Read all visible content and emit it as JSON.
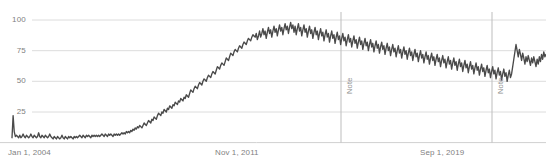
{
  "chart_data": {
    "type": "line",
    "title": "",
    "subtitle": "",
    "xlabel": "",
    "ylabel": "",
    "ylim": [
      0,
      100
    ],
    "grid": true,
    "legend": null,
    "legend_position": "none",
    "y_ticks": [
      100,
      75,
      50,
      25
    ],
    "y_tick_labels": [
      "100",
      "75",
      "50",
      "25"
    ],
    "x_tick_labels": [
      "Jan 1, 2004",
      "Nov 1, 2011",
      "Sep 1, 2019"
    ],
    "x_tick_positions_px": [
      8,
      215,
      420
    ],
    "annotations": [
      {
        "label": "Note",
        "x_px": 341
      },
      {
        "label": "Note",
        "x_px": 492
      }
    ],
    "line_color": "#4a4a4a",
    "grid_color": "#dcdcdc",
    "axis_text_color": "#7f7f7f",
    "series": [
      {
        "name": "Interest over time",
        "values": [
          4,
          22,
          9,
          5,
          6,
          5,
          4,
          6,
          4,
          5,
          7,
          5,
          4,
          6,
          5,
          4,
          5,
          7,
          5,
          4,
          6,
          5,
          4,
          5,
          8,
          5,
          4,
          6,
          5,
          4,
          6,
          5,
          4,
          5,
          7,
          5,
          4,
          3,
          5,
          4,
          3,
          5,
          4,
          3,
          4,
          6,
          4,
          3,
          5,
          4,
          3,
          5,
          4,
          5,
          4,
          3,
          5,
          4,
          5,
          4,
          5,
          6,
          5,
          4,
          6,
          5,
          4,
          6,
          5,
          6,
          5,
          4,
          6,
          5,
          6,
          5,
          6,
          5,
          6,
          5,
          6,
          7,
          6,
          5,
          7,
          6,
          5,
          7,
          6,
          7,
          6,
          5,
          7,
          6,
          7,
          6,
          7,
          6,
          7,
          8,
          7,
          8,
          7,
          9,
          8,
          9,
          8,
          10,
          9,
          11,
          10,
          12,
          11,
          13,
          12,
          14,
          13,
          12,
          14,
          16,
          15,
          14,
          16,
          18,
          17,
          16,
          19,
          18,
          21,
          20,
          19,
          22,
          24,
          23,
          22,
          25,
          24,
          27,
          26,
          25,
          28,
          27,
          30,
          29,
          28,
          31,
          30,
          33,
          32,
          31,
          34,
          33,
          36,
          35,
          34,
          37,
          36,
          39,
          38,
          37,
          40,
          43,
          42,
          41,
          44,
          46,
          45,
          44,
          47,
          49,
          48,
          47,
          50,
          52,
          51,
          50,
          53,
          55,
          54,
          53,
          56,
          58,
          57,
          56,
          59,
          62,
          61,
          60,
          63,
          65,
          64,
          63,
          66,
          69,
          68,
          67,
          70,
          73,
          72,
          71,
          74,
          76,
          75,
          74,
          77,
          79,
          78,
          77,
          80,
          82,
          81,
          80,
          83,
          85,
          84,
          83,
          86,
          88,
          87,
          86,
          89,
          84,
          87,
          91,
          86,
          89,
          93,
          88,
          91,
          85,
          90,
          94,
          89,
          92,
          86,
          91,
          95,
          90,
          93,
          87,
          92,
          96,
          91,
          94,
          88,
          93,
          97,
          92,
          95,
          89,
          94,
          98,
          93,
          96,
          90,
          95,
          88,
          93,
          97,
          91,
          94,
          87,
          92,
          96,
          90,
          93,
          86,
          91,
          95,
          89,
          92,
          85,
          90,
          94,
          88,
          91,
          84,
          89,
          93,
          87,
          90,
          83,
          88,
          92,
          86,
          89,
          82,
          87,
          91,
          85,
          88,
          81,
          86,
          90,
          84,
          87,
          80,
          85,
          89,
          83,
          86,
          79,
          84,
          88,
          82,
          85,
          78,
          83,
          87,
          81,
          84,
          77,
          82,
          86,
          80,
          83,
          76,
          81,
          85,
          79,
          82,
          75,
          80,
          84,
          78,
          81,
          74,
          79,
          83,
          77,
          80,
          73,
          78,
          82,
          76,
          79,
          72,
          77,
          81,
          75,
          78,
          71,
          76,
          80,
          74,
          77,
          70,
          75,
          79,
          73,
          76,
          69,
          74,
          78,
          72,
          75,
          68,
          73,
          77,
          71,
          74,
          67,
          72,
          76,
          70,
          73,
          66,
          71,
          75,
          69,
          72,
          65,
          70,
          74,
          68,
          71,
          64,
          69,
          73,
          67,
          70,
          63,
          68,
          72,
          66,
          69,
          62,
          67,
          71,
          65,
          68,
          61,
          66,
          70,
          64,
          67,
          60,
          65,
          69,
          63,
          66,
          59,
          64,
          68,
          62,
          65,
          58,
          63,
          67,
          61,
          64,
          57,
          62,
          66,
          60,
          63,
          56,
          61,
          65,
          59,
          62,
          55,
          60,
          64,
          58,
          61,
          54,
          59,
          63,
          57,
          60,
          53,
          58,
          62,
          56,
          59,
          52,
          57,
          61,
          55,
          58,
          51,
          56,
          60,
          54,
          57,
          50,
          55,
          59,
          53,
          56,
          62,
          68,
          74,
          80,
          75,
          70,
          76,
          72,
          67,
          73,
          69,
          64,
          70,
          66,
          71,
          67,
          63,
          69,
          65,
          70,
          66,
          62,
          68,
          64,
          70,
          66,
          72,
          68,
          74,
          70,
          72
        ]
      }
    ]
  }
}
